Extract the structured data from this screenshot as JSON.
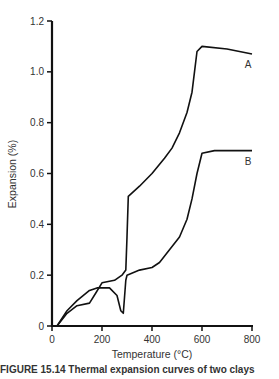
{
  "chart_data": {
    "type": "line",
    "title": "",
    "xlabel": "Temperature (°C)",
    "ylabel": "Expansion (%)",
    "xlim": [
      0,
      800
    ],
    "ylim": [
      0,
      1.2
    ],
    "xticks": [
      0,
      200,
      400,
      600,
      800
    ],
    "yticks": [
      0,
      0.2,
      0.4,
      0.6,
      0.8,
      1.0,
      1.2
    ],
    "xtick_labels": [
      "0",
      "200",
      "400",
      "600",
      "800"
    ],
    "ytick_labels": [
      "0",
      "0.2",
      "0.4",
      "0.6",
      "0.8",
      "1.0",
      "1.2"
    ],
    "grid": false,
    "legend": "inline labels at right end of curves",
    "series": [
      {
        "name": "A",
        "x": [
          20,
          60,
          100,
          150,
          175,
          200,
          250,
          280,
          295,
          300,
          305,
          350,
          400,
          450,
          480,
          510,
          540,
          560,
          570,
          580,
          600,
          700,
          800
        ],
        "y": [
          0,
          0.05,
          0.08,
          0.09,
          0.13,
          0.17,
          0.18,
          0.2,
          0.22,
          0.35,
          0.51,
          0.55,
          0.6,
          0.66,
          0.7,
          0.76,
          0.84,
          0.92,
          1.0,
          1.08,
          1.1,
          1.09,
          1.07
        ]
      },
      {
        "name": "B",
        "x": [
          20,
          60,
          100,
          150,
          180,
          230,
          260,
          275,
          285,
          295,
          300,
          350,
          400,
          430,
          470,
          510,
          540,
          560,
          580,
          600,
          650,
          800
        ],
        "y": [
          0,
          0.06,
          0.1,
          0.14,
          0.15,
          0.15,
          0.12,
          0.06,
          0.05,
          0.18,
          0.2,
          0.22,
          0.23,
          0.25,
          0.3,
          0.35,
          0.42,
          0.5,
          0.6,
          0.68,
          0.69,
          0.69
        ]
      }
    ]
  },
  "caption": "FIGURE 15.14   Thermal expansion curves of two clays"
}
